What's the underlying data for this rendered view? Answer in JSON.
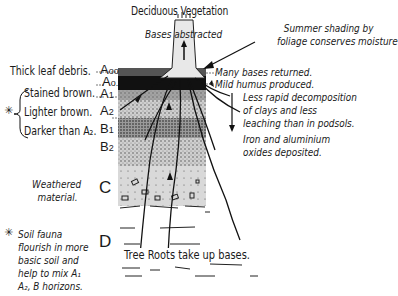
{
  "title": "Deciduous Vegetation",
  "subtitle": "Bases abstracted",
  "top_note": [
    "Summer shading by",
    "foliage conserves moisture"
  ],
  "horizons": [
    {
      "id": "Aoo",
      "main": "A",
      "sub": "oo",
      "desc": "Thick leaf debris."
    },
    {
      "id": "Ao",
      "main": "A",
      "sub": "o.",
      "desc": ""
    },
    {
      "id": "A1",
      "main": "A",
      "sub": "1",
      "desc": "Stained brown."
    },
    {
      "id": "A2",
      "main": "A",
      "sub": "2",
      "desc": "Lighter brown."
    },
    {
      "id": "B1",
      "main": "B",
      "sub": "1",
      "desc": "Darker than A₂."
    },
    {
      "id": "B2",
      "main": "B",
      "sub": "2",
      "desc": ""
    },
    {
      "id": "C",
      "main": "C",
      "sub": "",
      "desc": "Weathered material."
    },
    {
      "id": "D",
      "main": "D",
      "sub": "",
      "desc": ""
    }
  ],
  "left_notes": {
    "star": "✳",
    "weathered": [
      "Weathered",
      "material."
    ],
    "fauna": [
      "Soil fauna",
      "flourish in more",
      "basic soil and",
      "help to mix A₁",
      "A₂, B horizons."
    ]
  },
  "right_notes": {
    "bases_returned": "Many bases returned.",
    "mild_humus": "Mild humus produced.",
    "decomposition": [
      "Less rapid decomposition",
      "of clays and less",
      "leaching than in podsols."
    ],
    "iron": [
      "Iron and aluminium",
      "oxides deposited."
    ]
  },
  "bottom_caption": "Tree Roots take up bases."
}
